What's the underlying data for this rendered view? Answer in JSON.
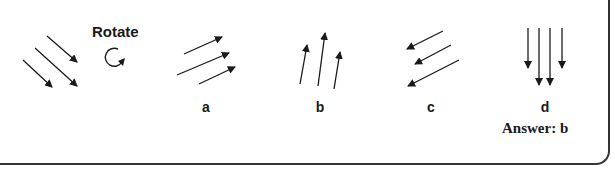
{
  "figure": {
    "rotate_label": "Rotate",
    "rotate_icon": "clockwise-rotate-icon",
    "original": {
      "description": "three parallel arrows pointing down-right",
      "arrows": [
        {
          "x1": 47,
          "y1": 36,
          "x2": 77,
          "y2": 62
        },
        {
          "x1": 35,
          "y1": 48,
          "x2": 77,
          "y2": 86
        },
        {
          "x1": 23,
          "y1": 60,
          "x2": 52,
          "y2": 87
        }
      ]
    },
    "options": [
      {
        "label": "a",
        "direction": "up-right",
        "arrows": [
          {
            "x1": 184,
            "y1": 54,
            "x2": 222,
            "y2": 37
          },
          {
            "x1": 177,
            "y1": 75,
            "x2": 229,
            "y2": 53
          },
          {
            "x1": 199,
            "y1": 84,
            "x2": 235,
            "y2": 67
          }
        ]
      },
      {
        "label": "b",
        "direction": "up",
        "arrows": [
          {
            "x1": 300,
            "y1": 84,
            "x2": 307,
            "y2": 45
          },
          {
            "x1": 318,
            "y1": 86,
            "x2": 325,
            "y2": 33
          },
          {
            "x1": 334,
            "y1": 89,
            "x2": 340,
            "y2": 52
          }
        ]
      },
      {
        "label": "c",
        "direction": "down-left",
        "arrows": [
          {
            "x1": 443,
            "y1": 31,
            "x2": 407,
            "y2": 49
          },
          {
            "x1": 451,
            "y1": 45,
            "x2": 415,
            "y2": 64
          },
          {
            "x1": 459,
            "y1": 60,
            "x2": 408,
            "y2": 86
          }
        ]
      },
      {
        "label": "d",
        "direction": "down",
        "arrows": [
          {
            "x1": 528,
            "y1": 28,
            "x2": 528,
            "y2": 68
          },
          {
            "x1": 539,
            "y1": 28,
            "x2": 539,
            "y2": 85
          },
          {
            "x1": 550,
            "y1": 28,
            "x2": 550,
            "y2": 85
          },
          {
            "x1": 562,
            "y1": 28,
            "x2": 562,
            "y2": 68
          }
        ]
      }
    ],
    "answer": "Answer: b",
    "colors": {
      "ink": "#1a1a1a",
      "border": "#333333",
      "background": "#ffffff"
    }
  }
}
